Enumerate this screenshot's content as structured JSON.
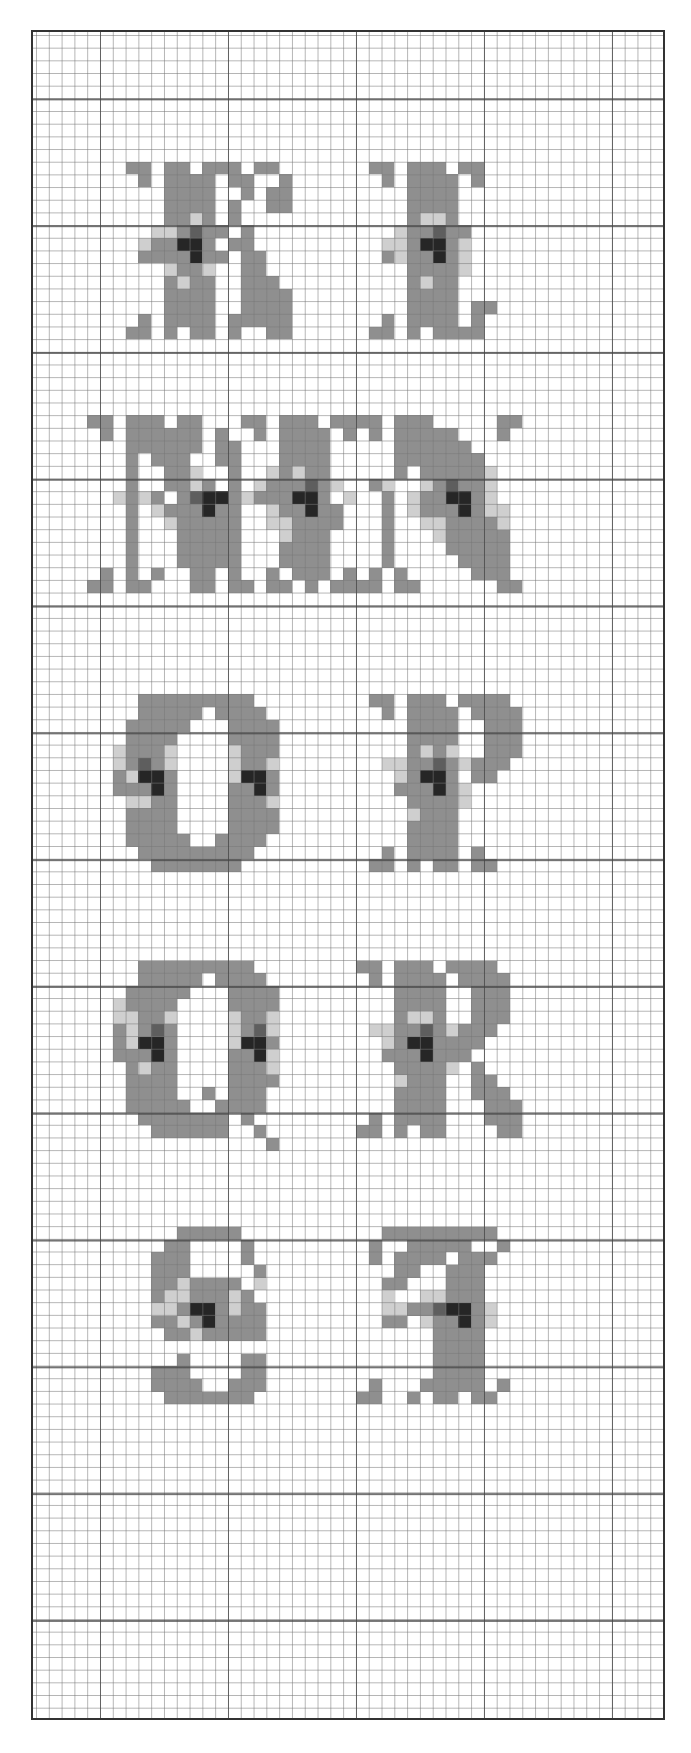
{
  "chart": {
    "title": "",
    "grid": {
      "cols": 49,
      "rows": 133,
      "cell_w": 12.8,
      "cell_h": 12.68,
      "offset_x": 3,
      "offset_y": 3,
      "major_every": 10
    },
    "palette": {
      "m": "#8f8f8f",
      "g": "#a3a3a3",
      "l": "#cfcfcf",
      "d": "#5e5e5e",
      "x": "#262626"
    }
  },
  "chart_data": {
    "type": "table",
    "letters": [
      {
        "char": "K",
        "col": 7,
        "row": 10,
        "bitmap": [
          "mm.mm.mmm.mm.",
          ".m.mmmm.mm..m",
          "...mmmm..m.mm",
          "...mmmm.m..mm",
          "...mmlm.m....",
          "..llmdmm.m...",
          ".lmmxxm.mm...",
          ".mmmmxmm.mm..",
          "...lmml..mm..",
          "...mlmm..mmm.",
          "...mmmm..mmmm",
          "...mmmm..mmmm",
          ".m.mmmm.mmmmm",
          "mm.m.mm.m..mm"
        ]
      },
      {
        "char": "L",
        "col": 26,
        "row": 10,
        "bitmap": [
          "mm.mmm.mm.",
          ".m.mmmm.m.",
          "...mmmm...",
          "...mmmm...",
          "...mllm...",
          "..lmmdmm..",
          ".llmxxml..",
          ".mlmmxml..",
          "...mmmml..",
          "...mlmm...",
          "...mmmm...",
          "...mmmm.mm",
          ".m.mmmm.m.",
          "mm.m.mmmm."
        ]
      },
      {
        "char": "M",
        "col": 4,
        "row": 30,
        "bitmap": [
          "mm.mmm.mm...mm.mmm.mm.",
          ".m.mmmmmm.m..m.mmmm.m.",
          "...mmmmmm.mm...mmmm...",
          "...m.mmm..mm...mmmm...",
          "...m..mml..m..lmlmm...",
          "...m..mmlm.m.lmmmdml..",
          "..lmlm.mdxxmlmmmxxm.l.",
          "...m.lmmmxmm..lmmxmm..",
          "...m..lmmmmm..llmmmm..",
          "...m...mmmmm...lmmm...",
          "...m...mmmmm...mmmm...",
          "...m...mmmmm...mmmm...",
          ".m.m.m..mm.m..m.mmm.m.",
          "mm.mm...mm.mm.mm.m.mm."
        ]
      },
      {
        "char": "N",
        "col": 25,
        "row": 30,
        "bitmap": [
          "mm.mmm.....mm",
          ".m.mmmmm...m.",
          "...mmmmmm....",
          "...mmmmmmm...",
          "...m.mmmmml..",
          ".ml..lmdmml..",
          "..m.lmmxxml..",
          "..m.lmmmxmll.",
          "..m..llmmmml.",
          "..m...lmmmmm.",
          "..m....mmmmm.",
          "..m.....mmmm.",
          ".m.m.....mmm.",
          "mm.mm......mm"
        ]
      },
      {
        "char": "O",
        "col": 6,
        "row": 52,
        "bitmap": [
          "..mmmmmmmmm..",
          "..mmmmm.mmmm.",
          ".mmmmm...mmmm",
          ".mmmm....mmmm",
          "lmmml....lmmm",
          "lmdml....lmml",
          "mlxxm....lxxm",
          "mmmxm....mmxm",
          ".llmm....mmml",
          ".mmmm....mmmm",
          ".mmmm....mmmm",
          ".mmmmm..mmmm.",
          "..mmmmmmmmm..",
          "...mmmmmmm..."
        ]
      },
      {
        "char": "P",
        "col": 26,
        "row": 52,
        "bitmap": [
          "mm.mmm.mmmm.",
          ".m.mmmm.mmmm",
          "...mmmm..mmm",
          "...mmmm..mmm",
          "...mlml..mmm",
          ".llmmdmlmmm.",
          "..lmxxm.mm..",
          "..mmmxml....",
          "...mmmml....",
          "...lmmm.....",
          "...mmmm.....",
          "...mmmm.....",
          ".m.mmmm.m...",
          "mm.m.mm.mm.."
        ]
      },
      {
        "char": "Q",
        "col": 6,
        "row": 73,
        "bitmap": [
          "..mmmmmmmmm..",
          "..mmmmm.mmmm.",
          ".mmmmm...mmmm",
          "lmmmm....mmmm",
          "llmml....lmml",
          "mlmdm....lmdl",
          "mlxxm....lxxm",
          "mmmxm....mmxl",
          ".mlmm....mmml",
          ".mmmm....mmmm",
          ".mmmm..m.mmm.",
          ".mmmmm..mmmm.",
          "..mmmmmmm.m..",
          "...mmmmmm..m.",
          "............m"
        ]
      },
      {
        "char": "R",
        "col": 25,
        "row": 73,
        "bitmap": [
          "mm.mmm.mmmm..",
          ".m.mmmm.mmmm.",
          "...mmmm..mmm.",
          "...mmmm..mmm.",
          "...mllm..mmm.",
          ".llmmdmlmmm..",
          "..lmxxmmmm...",
          "..mmmxmmm....",
          "...mmmml.m...",
          "...lmmm..mm..",
          "...mmmm..mmm.",
          "...mmmm...mmm",
          ".m.mmmm...mmm",
          "mm.m.mm....mm"
        ]
      },
      {
        "char": "S",
        "col": 8,
        "row": 94,
        "bitmap": [
          "...mmmmm..",
          "..mm....m.",
          ".mmm....m.",
          ".mmm.....m",
          ".mmlmmmm.l",
          ".mllmmmlm.",
          ".llmxxmlmm",
          ".mmlmxmmmm",
          "..mmlmmmmm",
          "..........",
          "...m....mm",
          ".mmm....mm",
          ".mmmm..mmm",
          "..mmmmmmm."
        ]
      },
      {
        "char": "T",
        "col": 25,
        "row": 94,
        "bitmap": [
          "..mmmmmmmmm.",
          ".m..mmmmm..m",
          ".m.mmmm.mmm.",
          "...mm..mmm..",
          "..mm...mmm..",
          "..l..llmmm..",
          "..llmmdxxml.",
          "..mm.lmmxml.",
          "......mmmm..",
          "......mmmm..",
          "......mmmm..",
          "......mmmm..",
          ".m...mmmmm.m",
          "mm..m.mm.mm."
        ]
      }
    ]
  }
}
